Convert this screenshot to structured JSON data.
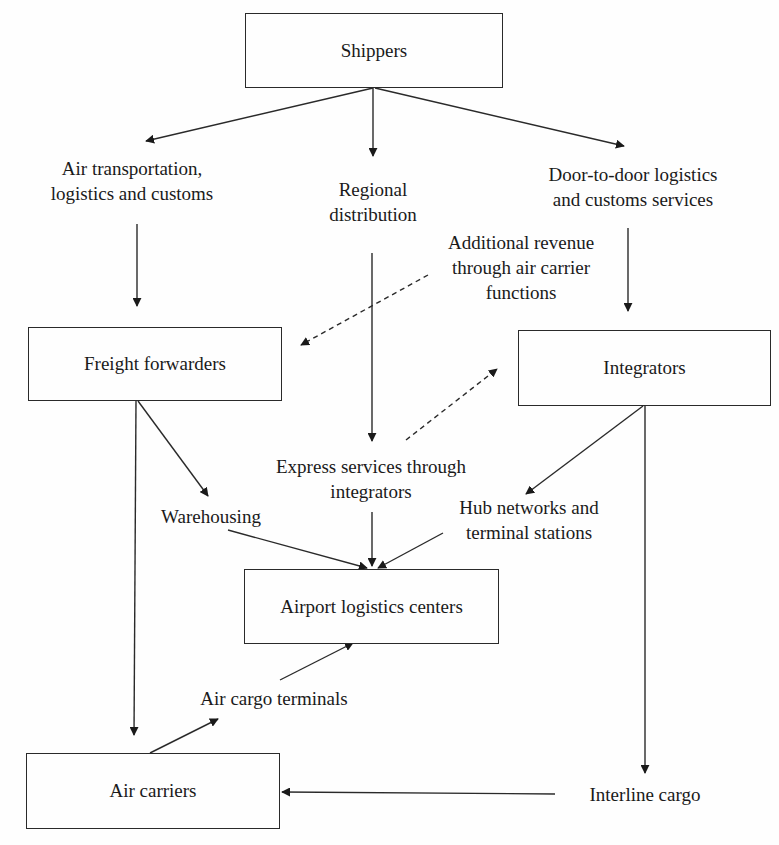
{
  "diagram": {
    "type": "flowchart",
    "nodes": {
      "shippers": "Shippers",
      "freight_forwarders": "Freight forwarders",
      "integrators": "Integrators",
      "airport_logistics_centers": "Airport logistics centers",
      "air_carriers": "Air carriers"
    },
    "labels": {
      "air_transportation": [
        "Air transportation,",
        "logistics and customs"
      ],
      "regional_distribution": [
        "Regional",
        "distribution"
      ],
      "door_to_door": [
        "Door-to-door logistics",
        "and customs services"
      ],
      "additional_revenue": [
        "Additional revenue",
        "through air carrier",
        "functions"
      ],
      "express_services": [
        "Express services through",
        "integrators"
      ],
      "warehousing": "Warehousing",
      "hub_networks": [
        "Hub networks and",
        "terminal stations"
      ],
      "air_cargo_terminals": "Air cargo terminals",
      "interline_cargo": "Interline cargo"
    },
    "edges": [
      {
        "from": "Shippers",
        "to": "Air transportation, logistics and customs",
        "style": "solid"
      },
      {
        "from": "Shippers",
        "to": "Regional distribution",
        "style": "solid"
      },
      {
        "from": "Shippers",
        "to": "Door-to-door logistics and customs services",
        "style": "solid"
      },
      {
        "from": "Air transportation, logistics and customs",
        "to": "Freight forwarders",
        "style": "solid"
      },
      {
        "from": "Door-to-door logistics and customs services",
        "to": "Integrators",
        "style": "solid"
      },
      {
        "from": "Regional distribution",
        "to": "Express services through integrators",
        "style": "solid"
      },
      {
        "from": "Additional revenue through air carrier functions",
        "to": "Freight forwarders",
        "style": "dashed"
      },
      {
        "from": "Express services through integrators",
        "to": "Integrators",
        "style": "dashed"
      },
      {
        "from": "Freight forwarders",
        "to": "Warehousing",
        "style": "solid"
      },
      {
        "from": "Freight forwarders",
        "to": "Air carriers",
        "style": "solid"
      },
      {
        "from": "Integrators",
        "to": "Hub networks and terminal stations",
        "style": "solid"
      },
      {
        "from": "Integrators",
        "to": "Interline cargo",
        "style": "solid"
      },
      {
        "from": "Warehousing",
        "to": "Airport logistics centers",
        "style": "solid"
      },
      {
        "from": "Express services through integrators",
        "to": "Airport logistics centers",
        "style": "solid"
      },
      {
        "from": "Hub networks and terminal stations",
        "to": "Airport logistics centers",
        "style": "solid"
      },
      {
        "from": "Air carriers",
        "to": "Air cargo terminals",
        "style": "solid"
      },
      {
        "from": "Air cargo terminals",
        "to": "Airport logistics centers",
        "style": "solid"
      },
      {
        "from": "Interline cargo",
        "to": "Air carriers",
        "style": "solid"
      }
    ]
  }
}
